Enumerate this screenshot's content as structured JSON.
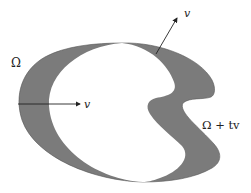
{
  "figure": {
    "labels": {
      "omega": "Ω",
      "omega_shifted": "Ω + tv",
      "v_horizontal": "v",
      "v_normal": "v"
    },
    "colors": {
      "shaded_region": "#7a7a7a",
      "background": "#ffffff",
      "stroke": "#222222"
    }
  }
}
